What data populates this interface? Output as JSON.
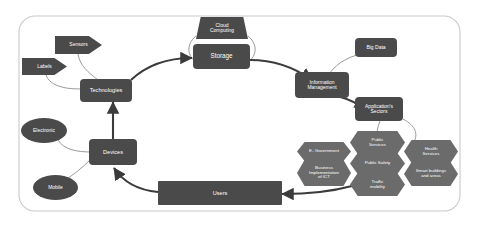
{
  "diagram": {
    "type": "flow-diagram",
    "colors": {
      "node_fill": "#4a4a4a",
      "hexagon_fill": "#6b6b6b",
      "node_text": "#ffffff",
      "background": "#ffffff",
      "border": "#c9c9c9",
      "edge_thick": "#3b3b3b",
      "edge_thin": "#9a9a9a"
    },
    "nodes": {
      "sensors": "Sensors",
      "labels": "Labels",
      "technologies": "Technologies",
      "cloud_computing": "Cloud\nComputing",
      "cloud_computing_line1": "Cloud",
      "cloud_computing_line2": "Computing",
      "storage": "Storage",
      "big_data": "Big Data",
      "information_management_line1": "Information",
      "information_management_line2": "Management",
      "applications_sectors_line1": "Application's",
      "applications_sectors_line2": "Sectors",
      "electronic": "Electronic",
      "mobile": "Mobile",
      "devices": "Devices",
      "users": "Users"
    },
    "sectors": {
      "e_government": "E- Government",
      "business_ict_line1": "Business",
      "business_ict_line2": "Implementation",
      "business_ict_line3": "of ICT",
      "public_services_line1": "Public",
      "public_services_line2": "Services",
      "public_safety": "Public Safety",
      "traffic_mobility_line1": "Traffic",
      "traffic_mobility_line2": "mobility",
      "health_services_line1": "Health",
      "health_services_line2": "Services",
      "smart_buildings_line1": "Smart buildings",
      "smart_buildings_line2": "and areas"
    }
  }
}
